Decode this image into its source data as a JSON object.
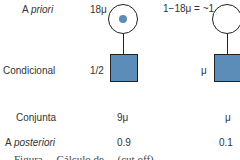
{
  "rows": {
    "prior": {
      "label_prefix": "A ",
      "label_italic": "priori"
    },
    "conditional": {
      "label": "Condicional"
    },
    "joint": {
      "label": "Conjunta"
    },
    "posterior": {
      "label_prefix": "A ",
      "label_italic": "posteriori"
    }
  },
  "hypotheses": [
    {
      "prior": "18μ",
      "conditional": "1/2",
      "joint": "9μ",
      "posterior": "0.9",
      "mother": "carrier"
    },
    {
      "prior": "1−18μ = ~1",
      "conditional": "μ",
      "joint": "μ",
      "posterior": "0.1",
      "mother": "non-carrier"
    }
  ],
  "caption": "Figura ... Cálculo de ... (cut off)",
  "colors": {
    "affected_fill": "#5b8db8",
    "carrier_dot": "#5b8db8",
    "line": "#222222"
  }
}
